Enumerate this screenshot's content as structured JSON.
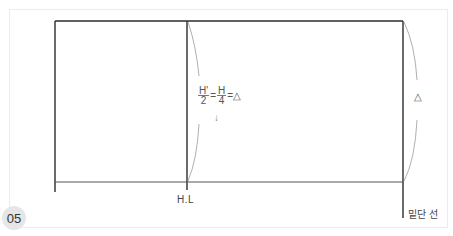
{
  "figure": {
    "number": "05",
    "labels": {
      "hip_line": "H.L",
      "hem_line": "밑단 선",
      "delta_symbol": "△"
    },
    "formula": {
      "frac1_num": "H'",
      "frac1_den": "2",
      "eq1": "=",
      "frac2_num": "H",
      "frac2_den": "4",
      "eq2": "=△",
      "arrow": "↓"
    },
    "colors": {
      "line": "#2b2b2b",
      "curve": "#9a9a9a",
      "frame": "#ececec",
      "badge": "#e6e6e6"
    }
  }
}
